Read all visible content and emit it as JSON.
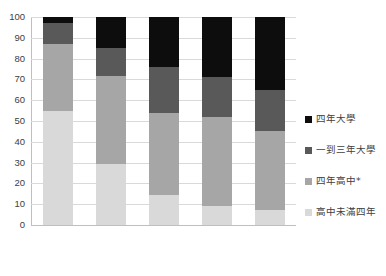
{
  "chart_data": {
    "type": "bar",
    "subtype": "stacked-bar-100-percent",
    "title": "",
    "subtitle": "",
    "xlabel": "",
    "ylabel": "",
    "ylim": [
      0,
      100
    ],
    "yticks": [
      0,
      10,
      20,
      30,
      40,
      50,
      60,
      70,
      80,
      90,
      100
    ],
    "ytick_labels": [
      "0",
      "10",
      "20",
      "30",
      "40",
      "50",
      "60",
      "70",
      "80",
      "90",
      "100"
    ],
    "grid": true,
    "grid_axis": "y",
    "legend_position": "right",
    "categories": [
      "",
      "",
      "",
      "",
      ""
    ],
    "xtick_labels": [
      "",
      "",
      "",
      "",
      ""
    ],
    "series": [
      {
        "name": "高中未滿四年",
        "color": "#d9d9d9",
        "values": [
          55,
          29.5,
          14.5,
          9,
          7
        ]
      },
      {
        "name": "四年高中*",
        "color": "#a6a6a6",
        "values": [
          32,
          42,
          39.5,
          43,
          38
        ]
      },
      {
        "name": "一到三年大學",
        "color": "#595959",
        "values": [
          10,
          13.5,
          22,
          19,
          20
        ]
      },
      {
        "name": "四年大學",
        "color": "#0d0d0d",
        "values": [
          3,
          15,
          24,
          29,
          35
        ]
      }
    ],
    "cumulative_tops": {
      "高中未滿四年": [
        55,
        29.5,
        14.5,
        9,
        7
      ],
      "四年高中*": [
        87,
        71.5,
        54,
        52,
        45
      ],
      "一到三年大學": [
        97,
        85,
        76,
        71,
        65
      ],
      "四年大學": [
        100,
        100,
        100,
        100,
        100
      ]
    }
  },
  "legend": {
    "items": [
      {
        "label": "四年大學",
        "color": "#0d0d0d",
        "name": "legend-item-four-year-college"
      },
      {
        "label": "一到三年大學",
        "color": "#595959",
        "name": "legend-item-one-to-three-year-college"
      },
      {
        "label": "四年高中*",
        "color": "#a6a6a6",
        "name": "legend-item-four-year-high-school"
      },
      {
        "label": "高中未滿四年",
        "color": "#d9d9d9",
        "name": "legend-item-less-than-four-year-high-school"
      }
    ]
  },
  "axis": {
    "y_labels": [
      "100",
      "90",
      "80",
      "70",
      "60",
      "50",
      "40",
      "30",
      "20",
      "10",
      "0"
    ]
  },
  "colors": {
    "gridline": "#d9d9d9",
    "axis_line": "#bfbfbf",
    "text": "#404040",
    "background": "#ffffff"
  }
}
